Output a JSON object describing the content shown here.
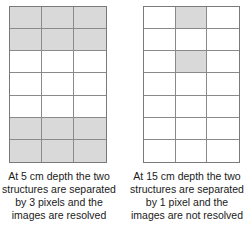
{
  "panels": [
    {
      "caption": "At 5 cm depth the two structures are separated by 3 pixels and the images are resolved",
      "rows": 7,
      "cols": 3,
      "shaded_rows": [
        0,
        1,
        5,
        6
      ],
      "shaded_cells": []
    },
    {
      "caption": "At 15 cm depth the two structures are separated by 1 pixel and the images are not resolved",
      "rows": 7,
      "cols": 3,
      "shaded_rows": [],
      "shaded_cells": [
        [
          0,
          1
        ],
        [
          2,
          1
        ]
      ]
    }
  ],
  "colors": {
    "shaded": "#d9d9d9",
    "grid_line": "#8a8a8a",
    "background": "#ffffff"
  }
}
